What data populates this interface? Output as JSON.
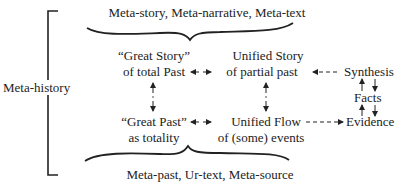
{
  "diagram": {
    "side_label": "Meta-history",
    "top_label": "Meta-story, Meta-narrative, Meta-text",
    "bottom_label": "Meta-past, Ur-text, Meta-source",
    "nodes": {
      "great_story": {
        "line1": "“Great Story”",
        "line2": "of total Past"
      },
      "unified_story": {
        "line1": "Unified Story",
        "line2": "of partial past"
      },
      "great_past": {
        "line1": "“Great Past”",
        "line2": "as totality"
      },
      "unified_flow": {
        "line1": "Unified Flow",
        "line2": "of (some) events"
      },
      "synthesis": "Synthesis",
      "facts": "Facts",
      "evidence": "Evidence"
    },
    "edges": [
      {
        "from": "great_story",
        "to": "unified_story",
        "style": "dashed",
        "direction": "both"
      },
      {
        "from": "great_past",
        "to": "unified_flow",
        "style": "dashed",
        "direction": "both"
      },
      {
        "from": "great_story",
        "to": "great_past",
        "style": "dashed",
        "direction": "both"
      },
      {
        "from": "unified_story",
        "to": "unified_flow",
        "style": "dashed",
        "direction": "both"
      },
      {
        "from": "synthesis",
        "to": "unified_story",
        "style": "dashed",
        "direction": "forward"
      },
      {
        "from": "unified_flow",
        "to": "evidence",
        "style": "dashed",
        "direction": "forward"
      },
      {
        "from": "synthesis",
        "to": "facts",
        "style": "solid",
        "direction": "both"
      },
      {
        "from": "facts",
        "to": "evidence",
        "style": "solid",
        "direction": "both"
      }
    ]
  }
}
